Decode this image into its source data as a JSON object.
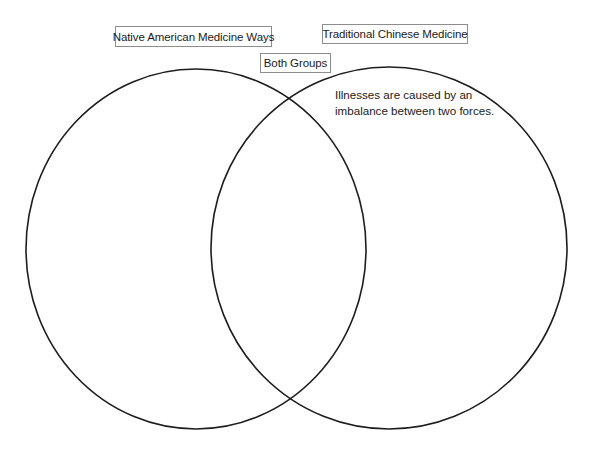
{
  "diagram": {
    "type": "venn",
    "title": "",
    "background_color": "#ffffff",
    "stroke_color": "#1d1d1d",
    "box_border_color": "#8d8d8d",
    "text_color": "#1b1b1b",
    "circles": [
      {
        "id": "left-circle",
        "label": "Native American Medicine Ways",
        "cx": 196,
        "cy": 249,
        "rx": 170,
        "ry": 180
      },
      {
        "id": "right-circle",
        "label": "Traditional Chinese Medicine",
        "cx": 389,
        "cy": 248,
        "rx": 178,
        "ry": 181
      }
    ],
    "labels": {
      "left": "Native American Medicine Ways",
      "right": "Traditional Chinese Medicine",
      "overlap": "Both Groups"
    },
    "entries": {
      "left_only": [],
      "overlap": [],
      "right_only": [
        {
          "lines": [
            "Illnesses are caused by an",
            "imbalance between two forces."
          ],
          "text": "Illnesses are caused by an imbalance between two forces."
        }
      ]
    }
  }
}
